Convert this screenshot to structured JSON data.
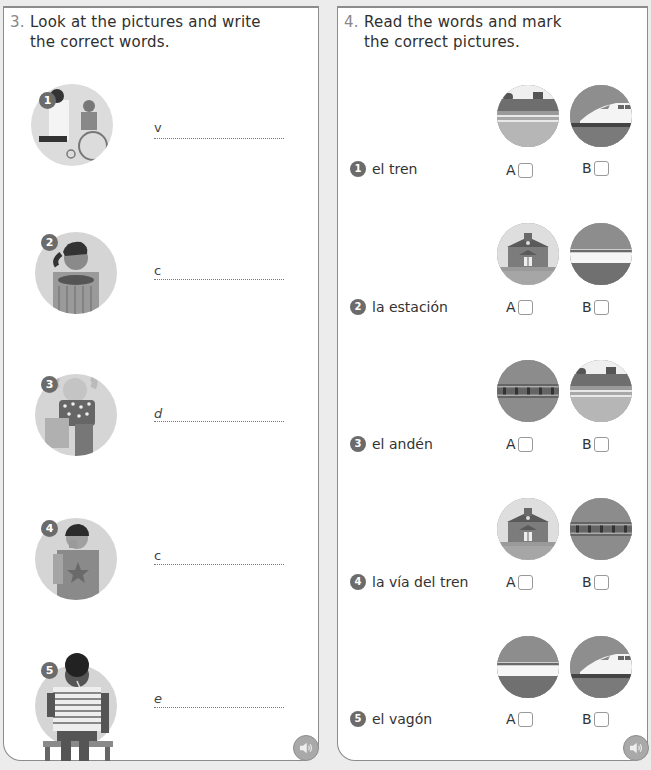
{
  "exercise3": {
    "number": "3.",
    "instruction_line1": "Look at the pictures and write",
    "instruction_line2": "the correct words.",
    "items": [
      {
        "badge": "1",
        "hint": "v",
        "picture": "doctor-with-patient-in-wheelchair"
      },
      {
        "badge": "2",
        "hint": "c",
        "picture": "girl-with-bowl"
      },
      {
        "badge": "3",
        "hint": "d",
        "picture": "girl-with-spots-hugging"
      },
      {
        "badge": "4",
        "hint": "c",
        "picture": "boy-coughing"
      },
      {
        "badge": "5",
        "hint": "e",
        "picture": "boy-with-thermometer-sitting"
      }
    ],
    "audio_icon": "speaker-icon"
  },
  "exercise4": {
    "number": "4.",
    "instruction_line1": "Read the words and mark",
    "instruction_line2": "the correct pictures.",
    "items": [
      {
        "badge": "1",
        "word": "el tren",
        "option_a": "A",
        "option_b": "B",
        "picture_a": "platform",
        "picture_b": "high-speed-train"
      },
      {
        "badge": "2",
        "word": "la estación",
        "option_a": "A",
        "option_b": "B",
        "picture_a": "station-building",
        "picture_b": "train-carriage"
      },
      {
        "badge": "3",
        "word": "el andén",
        "option_a": "A",
        "option_b": "B",
        "picture_a": "railway-track",
        "picture_b": "platform"
      },
      {
        "badge": "4",
        "word": "la vía del tren",
        "option_a": "A",
        "option_b": "B",
        "picture_a": "station-building",
        "picture_b": "railway-track"
      },
      {
        "badge": "5",
        "word": "el vagón",
        "option_a": "A",
        "option_b": "B",
        "picture_a": "train-carriage",
        "picture_b": "high-speed-train"
      }
    ],
    "audio_icon": "speaker-icon"
  },
  "colors": {
    "panel_border": "#8c8c8c",
    "badge": "#6b6b6b",
    "background": "#ececec"
  }
}
